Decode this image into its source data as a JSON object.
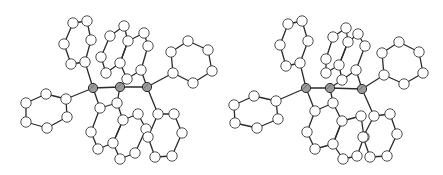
{
  "figure": {
    "kind": "stereo-pair molecular structure (ball-and-stick)",
    "width": 443,
    "height": 175,
    "colors": {
      "background": "#ffffff",
      "bond": "#2a2a2a",
      "atom_fill": "#ffffff",
      "atom_stroke": "#3a3a3a",
      "metal_fill": "#9a9a9a"
    },
    "atom_radius": 5.2,
    "metal_radius": 4.6
  },
  "views": [
    {
      "name": "left-view",
      "metals": [
        [
          93,
          88
        ],
        [
          120,
          87
        ],
        [
          147,
          87
        ]
      ],
      "metal_bonds": [
        [
          0,
          1
        ],
        [
          1,
          2
        ]
      ],
      "rings": [
        [
          [
            73,
            23
          ],
          [
            87,
            21
          ],
          [
            91,
            40
          ],
          [
            85,
            62
          ],
          [
            71,
            64
          ],
          [
            64,
            44
          ]
        ],
        [
          [
            124,
            26
          ],
          [
            110,
            36
          ],
          [
            101,
            57
          ],
          [
            106,
            73
          ],
          [
            120,
            63
          ],
          [
            128,
            41
          ]
        ],
        [
          [
            128,
            41
          ],
          [
            144,
            33
          ],
          [
            148,
            46
          ],
          [
            141,
            70
          ],
          [
            127,
            79
          ],
          [
            120,
            63
          ]
        ],
        [
          [
            188,
            41
          ],
          [
            208,
            50
          ],
          [
            212,
            71
          ],
          [
            193,
            83
          ],
          [
            173,
            73
          ],
          [
            171,
            52
          ]
        ],
        [
          [
            46,
            94
          ],
          [
            66,
            99
          ],
          [
            67,
            117
          ],
          [
            47,
            128
          ],
          [
            26,
            122
          ],
          [
            26,
            103
          ]
        ],
        [
          [
            100,
            108
          ],
          [
            117,
            103
          ],
          [
            123,
            120
          ],
          [
            113,
            143
          ],
          [
            98,
            149
          ],
          [
            91,
            132
          ]
        ],
        [
          [
            123,
            120
          ],
          [
            138,
            114
          ],
          [
            146,
            129
          ],
          [
            135,
            153
          ],
          [
            120,
            159
          ],
          [
            113,
            143
          ]
        ],
        [
          [
            158,
            114
          ],
          [
            174,
            114
          ],
          [
            182,
            133
          ],
          [
            172,
            156
          ],
          [
            155,
            157
          ],
          [
            148,
            137
          ]
        ]
      ],
      "metal_ring_bonds": [
        [
          0,
          [
            85,
            62
          ]
        ],
        [
          0,
          [
            66,
            99
          ]
        ],
        [
          0,
          [
            100,
            108
          ]
        ],
        [
          1,
          [
            127,
            79
          ]
        ],
        [
          1,
          [
            117,
            103
          ]
        ],
        [
          2,
          [
            141,
            70
          ]
        ],
        [
          2,
          [
            173,
            73
          ]
        ],
        [
          2,
          [
            158,
            114
          ]
        ]
      ]
    },
    {
      "name": "right-view",
      "metals": [
        [
          306,
          88
        ],
        [
          330,
          88
        ],
        [
          362,
          89
        ]
      ],
      "metal_bonds": [
        [
          0,
          1
        ],
        [
          1,
          2
        ]
      ],
      "rings": [
        [
          [
            288,
            24
          ],
          [
            302,
            21
          ],
          [
            308,
            41
          ],
          [
            300,
            63
          ],
          [
            286,
            66
          ],
          [
            280,
            45
          ]
        ],
        [
          [
            346,
            28
          ],
          [
            333,
            37
          ],
          [
            326,
            59
          ],
          [
            326,
            73
          ],
          [
            339,
            65
          ],
          [
            348,
            42
          ]
        ],
        [
          [
            348,
            42
          ],
          [
            358,
            34
          ],
          [
            365,
            46
          ],
          [
            356,
            70
          ],
          [
            342,
            80
          ],
          [
            339,
            65
          ]
        ],
        [
          [
            399,
            42
          ],
          [
            419,
            52
          ],
          [
            423,
            73
          ],
          [
            404,
            84
          ],
          [
            384,
            75
          ],
          [
            382,
            53
          ]
        ],
        [
          [
            254,
            96
          ],
          [
            276,
            101
          ],
          [
            278,
            119
          ],
          [
            257,
            128
          ],
          [
            235,
            123
          ],
          [
            234,
            105
          ]
        ],
        [
          [
            315,
            111
          ],
          [
            333,
            103
          ],
          [
            342,
            121
          ],
          [
            333,
            144
          ],
          [
            315,
            149
          ],
          [
            307,
            132
          ]
        ],
        [
          [
            342,
            121
          ],
          [
            361,
            116
          ],
          [
            364,
            137
          ],
          [
            357,
            156
          ],
          [
            343,
            159
          ],
          [
            333,
            144
          ]
        ],
        [
          [
            374,
            116
          ],
          [
            390,
            114
          ],
          [
            397,
            134
          ],
          [
            387,
            156
          ],
          [
            370,
            157
          ],
          [
            363,
            137
          ]
        ]
      ],
      "metal_ring_bonds": [
        [
          0,
          [
            300,
            63
          ]
        ],
        [
          0,
          [
            276,
            101
          ]
        ],
        [
          0,
          [
            315,
            111
          ]
        ],
        [
          1,
          [
            342,
            80
          ]
        ],
        [
          1,
          [
            333,
            103
          ]
        ],
        [
          2,
          [
            356,
            70
          ]
        ],
        [
          2,
          [
            384,
            75
          ]
        ],
        [
          2,
          [
            374,
            116
          ]
        ]
      ]
    }
  ]
}
